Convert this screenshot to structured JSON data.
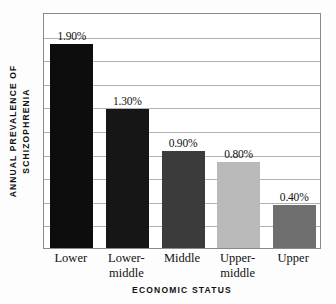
{
  "chart_data": {
    "type": "bar",
    "title": "",
    "xlabel": "ECONOMIC STATUS",
    "ylabel": "ANNUAL PREVALENCE OF SCHIZOPHRENIA",
    "ylabel_line1": "ANNUAL PREVALENCE OF",
    "ylabel_line2": "SCHIZOPHRENIA",
    "categories": [
      "Lower",
      "Lower-middle",
      "Middle",
      "Upper-middle",
      "Upper"
    ],
    "category_lines": [
      {
        "line1": "Lower",
        "line2": ""
      },
      {
        "line1": "Lower-",
        "line2": "middle"
      },
      {
        "line1": "Middle",
        "line2": ""
      },
      {
        "line1": "Upper-",
        "line2": "middle"
      },
      {
        "line1": "Upper",
        "line2": ""
      }
    ],
    "values": [
      1.9,
      1.3,
      0.9,
      0.8,
      0.4
    ],
    "value_labels": [
      "1.90%",
      "1.30%",
      "0.90%",
      "0.80%",
      "0.40%"
    ],
    "bar_colors": [
      "#0d0d0d",
      "#161616",
      "#3b3b3b",
      "#b9b9b9",
      "#6e6e6e"
    ],
    "ylim": [
      0,
      2.2
    ],
    "grid": true,
    "gridline_count": 9,
    "legend": "none",
    "axis_color": "#8a8a8a",
    "gridline_color": "#b0b0b0",
    "background": "#ffffff"
  }
}
